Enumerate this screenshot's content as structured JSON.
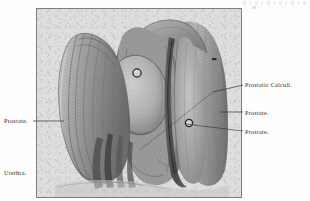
{
  "plate": {
    "kind": "anatomical-engraving",
    "subject": "Prostate with prostatic calculi, urethra opened",
    "frame_color": "#7e7e7e",
    "paper_color": "#dedede",
    "ink_color": "#2c2c2c"
  },
  "labels": {
    "left_prostate": "Prostate.",
    "left_urethra": "Urethra.",
    "right_calculi": "Prostatic Calculi.",
    "right_prostate_mid": "Prostate.",
    "right_prostate_low": "Prostate."
  },
  "artifact": {
    "top_right_smudge": ""
  }
}
